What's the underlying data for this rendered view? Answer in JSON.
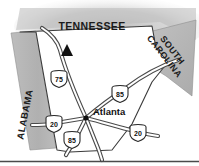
{
  "figure": {
    "type": "locator-map",
    "region": "Georgia and surrounding states",
    "width": 199,
    "height": 166
  },
  "colors": {
    "neighbor_fill": "#b3b3b3",
    "neighbor_fill_light": "#c4c4c4",
    "state_fill": "#ffffff",
    "outline": "#3a3a3a",
    "road": "#4a4a4a",
    "text": "#1a1a1a",
    "shadow": "#c9c9c9",
    "rule": "#4a4a4a"
  },
  "states": [
    {
      "id": "tennessee",
      "label": "TENNESSEE",
      "rotation": 0
    },
    {
      "id": "south-carolina",
      "label_line1": "SOUTH",
      "label_line2": "CAROLINA",
      "rotation": 52
    },
    {
      "id": "alabama",
      "label": "ALABAMA",
      "rotation": -72
    }
  ],
  "city": {
    "name": "Atlanta",
    "marker": "city-dot"
  },
  "markers": [
    {
      "id": "peak-marker",
      "symbol": "triangle"
    }
  ],
  "highways": [
    {
      "id": "i75-north",
      "number": "75",
      "shield": "interstate-shield"
    },
    {
      "id": "i85-northeast",
      "number": "85",
      "shield": "interstate-shield"
    },
    {
      "id": "i20-west",
      "number": "20",
      "shield": "interstate-shield"
    },
    {
      "id": "i85-southwest",
      "number": "85",
      "shield": "interstate-shield"
    },
    {
      "id": "i20-east",
      "number": "20",
      "shield": "interstate-shield"
    }
  ]
}
